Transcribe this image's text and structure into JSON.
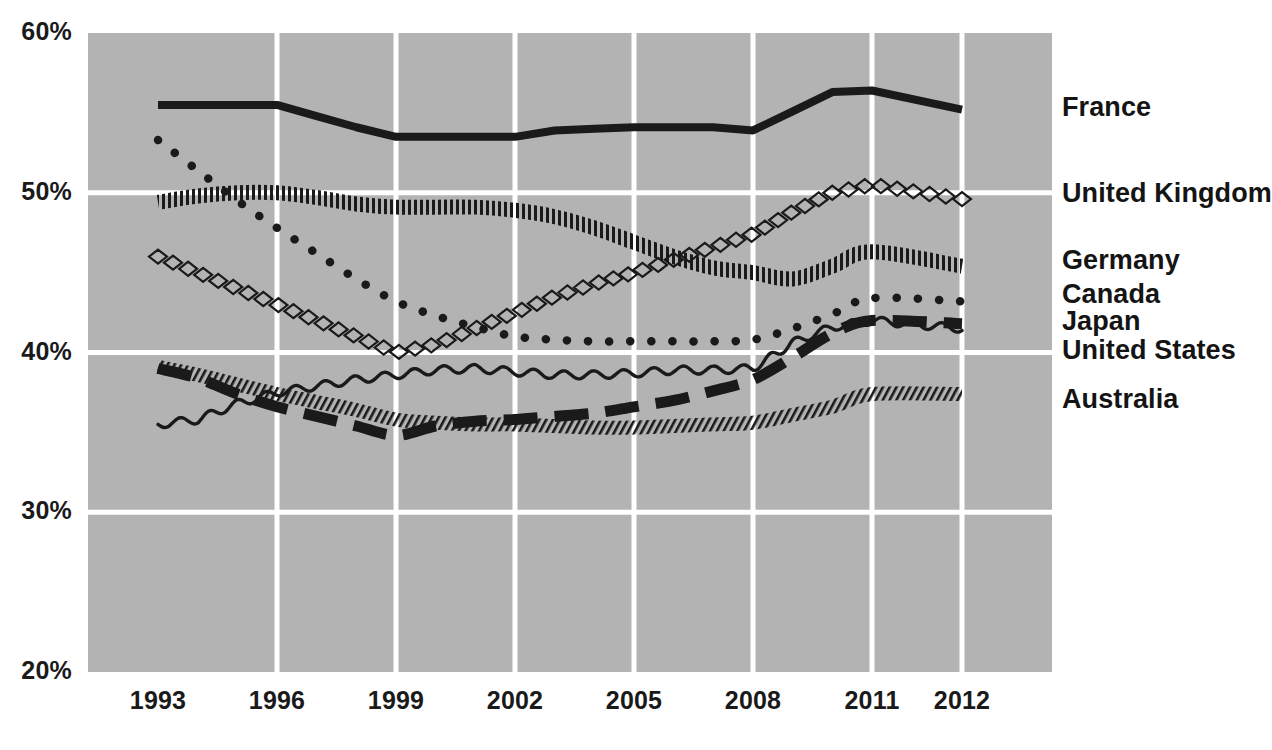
{
  "chart_data": {
    "type": "line",
    "title": "",
    "subtitle": "",
    "xlabel": "",
    "ylabel": "",
    "xlim": [
      1993,
      2012
    ],
    "ylim": [
      20,
      60
    ],
    "yticks": [
      "20%",
      "30%",
      "40%",
      "50%",
      "60%"
    ],
    "ytick_values": [
      20,
      30,
      40,
      50,
      60
    ],
    "xticks": [
      "1993",
      "1996",
      "1999",
      "2002",
      "2005",
      "2008",
      "2011",
      "2012"
    ],
    "xtick_values": [
      1993,
      1996,
      1999,
      2002,
      2005,
      2008,
      2011,
      2012
    ],
    "grid": true,
    "grid_color": "#ffffff",
    "plot_background": "#b3b3b3",
    "legend_position": "right-inline",
    "line_color": "#1a1a1a",
    "x": [
      1993,
      1994,
      1995,
      1996,
      1997,
      1998,
      1999,
      2000,
      2001,
      2002,
      2003,
      2004,
      2005,
      2006,
      2007,
      2008,
      2009,
      2010,
      2011,
      2012
    ],
    "series": [
      {
        "name": "France",
        "style": "solid",
        "values": [
          55.5,
          55.5,
          55.5,
          55.5,
          54.8,
          54.1,
          53.5,
          53.5,
          53.5,
          53.5,
          53.9,
          54.0,
          54.1,
          54.1,
          54.1,
          53.9,
          55.1,
          56.3,
          56.4,
          55.2
        ]
      },
      {
        "name": "United Kingdom",
        "style": "diamond-chain",
        "values": [
          46.0,
          45.0,
          44.0,
          43.0,
          42.0,
          41.0,
          40.0,
          40.5,
          41.5,
          42.5,
          43.5,
          44.3,
          45.0,
          45.8,
          46.6,
          47.4,
          48.8,
          50.0,
          50.5,
          49.6
        ]
      },
      {
        "name": "Germany",
        "style": "vertical-hatch",
        "values": [
          49.4,
          49.8,
          50.0,
          50.0,
          49.7,
          49.3,
          49.1,
          49.1,
          49.1,
          48.9,
          48.5,
          47.8,
          46.9,
          46.0,
          45.3,
          45.0,
          44.6,
          45.4,
          46.3,
          45.4
        ]
      },
      {
        "name": "Canada",
        "style": "dotted",
        "values": [
          53.3,
          51.4,
          49.5,
          47.8,
          46.2,
          44.6,
          43.2,
          42.3,
          41.6,
          41.0,
          40.8,
          40.7,
          40.7,
          40.7,
          40.7,
          40.8,
          41.5,
          42.4,
          43.4,
          43.2
        ]
      },
      {
        "name": "Japan",
        "style": "long-dash",
        "values": [
          39.0,
          38.4,
          37.4,
          36.6,
          36.0,
          35.4,
          34.8,
          35.4,
          35.7,
          35.8,
          36.0,
          36.2,
          36.6,
          37.0,
          37.6,
          38.3,
          39.7,
          41.2,
          42.0,
          41.8
        ]
      },
      {
        "name": "United States",
        "style": "wavy",
        "values": [
          35.5,
          35.8,
          36.8,
          37.5,
          37.9,
          38.3,
          38.6,
          38.9,
          39.0,
          38.8,
          38.6,
          38.6,
          38.7,
          38.9,
          38.9,
          39.0,
          40.6,
          41.6,
          42.0,
          41.5
        ]
      },
      {
        "name": "Australia",
        "style": "diagonal-hatch",
        "values": [
          39.1,
          38.6,
          38.0,
          37.4,
          36.9,
          36.4,
          35.8,
          35.6,
          35.5,
          35.5,
          35.4,
          35.3,
          35.3,
          35.4,
          35.5,
          35.6,
          36.1,
          36.6,
          37.4,
          37.4
        ]
      }
    ],
    "series_label_y_percent": [
      55.2,
      49.8,
      45.6,
      43.5,
      41.8,
      40.0,
      36.9
    ]
  }
}
